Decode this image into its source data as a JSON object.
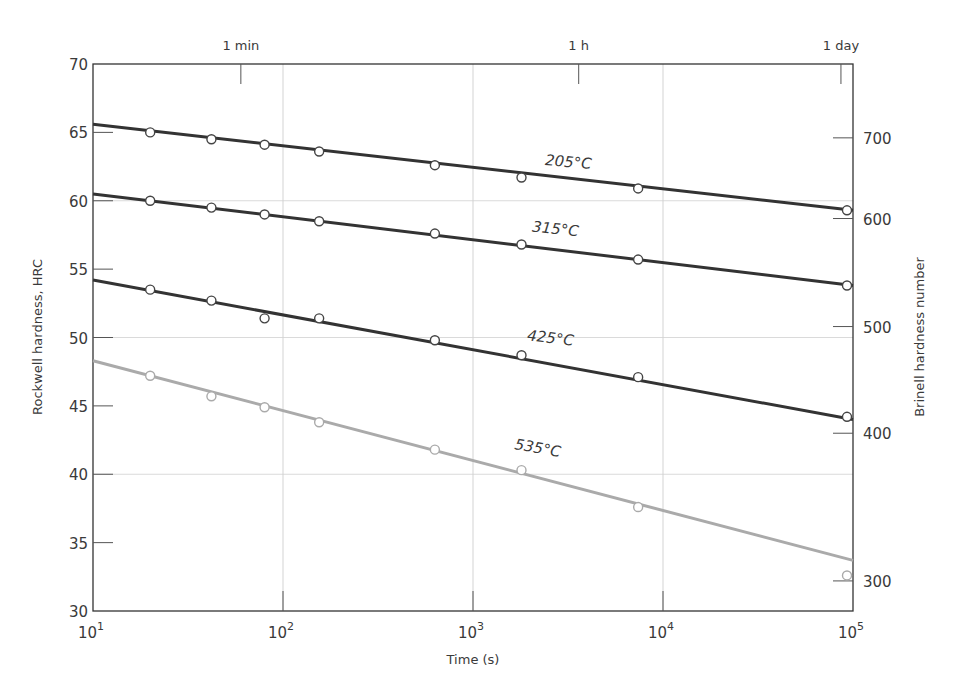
{
  "chart_data": {
    "type": "line",
    "title": "",
    "xlabel": "Time (s)",
    "ylabel": "Rockwell hardness, HRC",
    "y2label": "Brinell hardness number",
    "xscale": "log",
    "xlim": [
      10,
      100000
    ],
    "ylim": [
      30,
      70
    ],
    "x_ticks": [
      {
        "value": 10,
        "base": "10",
        "exp": "1"
      },
      {
        "value": 100,
        "base": "10",
        "exp": "2"
      },
      {
        "value": 1000,
        "base": "10",
        "exp": "3"
      },
      {
        "value": 10000,
        "base": "10",
        "exp": "4"
      },
      {
        "value": 100000,
        "base": "10",
        "exp": "5"
      }
    ],
    "y_ticks": [
      30,
      35,
      40,
      45,
      50,
      55,
      60,
      65,
      70
    ],
    "y2_ticks": [
      {
        "label": "700",
        "hrc": 64.6
      },
      {
        "label": "600",
        "hrc": 58.7
      },
      {
        "label": "500",
        "hrc": 50.8
      },
      {
        "label": "400",
        "hrc": 43.0
      },
      {
        "label": "300",
        "hrc": 32.2
      }
    ],
    "top_ticks": [
      {
        "label": "1 min",
        "value": 60
      },
      {
        "label": "1 h",
        "value": 3600
      },
      {
        "label": "1 day",
        "value": 86400
      }
    ],
    "grid": {
      "x": [
        100,
        1000,
        10000
      ],
      "y": [
        40,
        50,
        60
      ]
    },
    "x": [
      20,
      42,
      80,
      155,
      630,
      1800,
      7400,
      100000
    ],
    "series": [
      {
        "name": "205°C",
        "color": "#333333",
        "line": {
          "start": 65.6,
          "end": 59.3
        },
        "values": [
          65.0,
          64.5,
          64.1,
          63.6,
          62.6,
          61.7,
          60.9,
          59.3
        ],
        "label_pos": {
          "x": 568,
          "y": 167,
          "angle": 5
        }
      },
      {
        "name": "315°C",
        "color": "#333333",
        "line": {
          "start": 60.5,
          "end": 53.8
        },
        "values": [
          60.0,
          59.5,
          59.0,
          58.5,
          57.6,
          56.8,
          55.7,
          53.8
        ],
        "label_pos": {
          "x": 555,
          "y": 234,
          "angle": 6
        }
      },
      {
        "name": "425°C",
        "color": "#333333",
        "line": {
          "start": 54.2,
          "end": 44.0
        },
        "values": [
          53.5,
          52.7,
          51.4,
          51.4,
          49.8,
          48.7,
          47.1,
          44.2
        ],
        "label_pos": {
          "x": 550,
          "y": 343,
          "angle": 7
        }
      },
      {
        "name": "535°C",
        "color": "#aaaaaa",
        "line": {
          "start": 48.3,
          "end": 33.7
        },
        "values": [
          47.2,
          45.7,
          44.9,
          43.8,
          41.8,
          40.3,
          37.6,
          32.6
        ],
        "label_pos": {
          "x": 537,
          "y": 453,
          "angle": 10
        }
      }
    ]
  },
  "layout": {
    "plot": {
      "left": 93,
      "right": 853,
      "top": 64,
      "bottom": 611
    }
  }
}
